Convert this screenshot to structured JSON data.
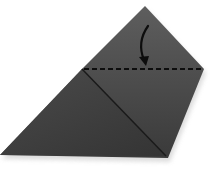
{
  "diagram": {
    "type": "origami-fold-step",
    "colors": {
      "background": "#ffffff",
      "paper_top": "#5a5a5a",
      "paper_bottom": "#3e3e3e",
      "crease": "#1a1a1a",
      "dashed_line": "#0d0d0d",
      "arrow": "#0d0d0d",
      "shadow": "#d8d8d8"
    },
    "shape": {
      "apex": [
        145,
        6
      ],
      "left_fold_point": [
        82,
        69
      ],
      "right_fold_point": [
        204,
        69
      ],
      "bottom_left": [
        0,
        155
      ],
      "bottom_right": [
        168,
        158
      ]
    },
    "fold_line": {
      "style": "dashed",
      "label": "valley fold line"
    },
    "arrow": {
      "direction": "down",
      "label": "fold down arrow"
    },
    "crease_line": {
      "label": "diagonal crease"
    }
  }
}
